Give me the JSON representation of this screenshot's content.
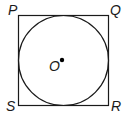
{
  "diagram": {
    "square": {
      "vertices": [
        "P",
        "Q",
        "R",
        "S"
      ],
      "x": 18.5,
      "y": 15.5,
      "size": 90
    },
    "circle": {
      "center_label": "O",
      "cx": 63.5,
      "cy": 60.5,
      "r": 45
    },
    "labels": {
      "P": "P",
      "Q": "Q",
      "R": "R",
      "S": "S",
      "O": "O"
    },
    "colors": {
      "stroke": "#1a1a1a",
      "background": "#ffffff"
    }
  }
}
